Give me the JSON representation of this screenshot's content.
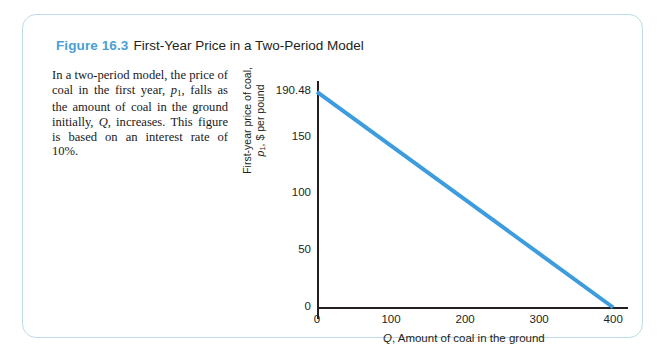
{
  "figure": {
    "number": "Figure 16.3",
    "title": "First-Year Price in a Two-Period Model",
    "accent_color": "#4a9fd5",
    "frame_border_color": "#bcdcea"
  },
  "caption": {
    "line1": "In a two-period model, the price",
    "line2_a": "of coal in the first year, ",
    "line2_var": "p",
    "line2_sub": "1",
    "line2_b": ", falls",
    "line3": "as the amount of coal in the",
    "line4_a": "ground initially, ",
    "line4_var": "Q",
    "line4_b": ", increases.",
    "line5": "This figure is based on an",
    "line6": "interest rate of 10%."
  },
  "chart_data": {
    "type": "line",
    "title": "First-Year Price in a Two-Period Model",
    "xlabel": "Q, Amount of coal in the ground",
    "ylabel": "First-year price of coal, p1, $ per pound",
    "ylabel_line1": "First-year price of coal,",
    "ylabel_line2_var": "p",
    "ylabel_line2_sub": "1",
    "ylabel_line2_rest": ", $ per pound",
    "series": [
      {
        "name": "First-year price",
        "color": "#3d9cdd",
        "line_width": 4,
        "x": [
          0,
          400
        ],
        "y": [
          190.48,
          0
        ]
      }
    ],
    "xlim": [
      0,
      420
    ],
    "ylim": [
      0,
      200
    ],
    "xticks": [
      {
        "value": 0,
        "label": "0"
      },
      {
        "value": 100,
        "label": "100"
      },
      {
        "value": 200,
        "label": "200"
      },
      {
        "value": 300,
        "label": "300"
      },
      {
        "value": 400,
        "label": "400"
      }
    ],
    "yticks": [
      {
        "value": 0,
        "label": "0"
      },
      {
        "value": 50,
        "label": "50"
      },
      {
        "value": 100,
        "label": "100"
      },
      {
        "value": 150,
        "label": "150"
      },
      {
        "value": 190.48,
        "label": "190.48"
      }
    ],
    "grid": false,
    "legend": null,
    "axis_color": "#231f20"
  }
}
